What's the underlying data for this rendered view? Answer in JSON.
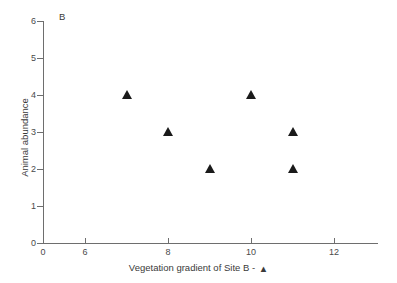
{
  "panel": {
    "label": "B"
  },
  "axes": {
    "y_title": "Animal abundance",
    "x_title": "Vegetation gradient of Site B -",
    "legend_marker_glyph": "▲",
    "y_ticks": [
      "0",
      "1",
      "2",
      "3",
      "4",
      "5",
      "6"
    ],
    "x_ticks": [
      "0",
      "6",
      "8",
      "10",
      "12"
    ]
  },
  "chart_data": {
    "type": "scatter",
    "title": "B",
    "xlabel": "Vegetation gradient of Site B -",
    "ylabel": "Animal abundance",
    "grid": false,
    "legend": "none",
    "marker": "triangle-up-filled",
    "marker_color": "#1a1a1a",
    "axis_color": "#6e6e6e",
    "xlim": [
      0,
      13
    ],
    "ylim": [
      0,
      6
    ],
    "xticks": [
      0,
      6,
      8,
      10,
      12
    ],
    "yticks": [
      0,
      1,
      2,
      3,
      4,
      5,
      6
    ],
    "x_axis_note": "broken/compressed segment between 0 and 6; uniform spacing from 6 to 12",
    "series": [
      {
        "name": "Site B",
        "points": [
          {
            "x": 7,
            "y": 4
          },
          {
            "x": 8,
            "y": 3
          },
          {
            "x": 9,
            "y": 2
          },
          {
            "x": 10,
            "y": 4
          },
          {
            "x": 11,
            "y": 3
          },
          {
            "x": 11,
            "y": 2
          }
        ]
      }
    ]
  },
  "geometry": {
    "x_pixel_of_zero": 43,
    "x_pixel_of_six": 85,
    "px_per_unit_x": 41.5,
    "y_pixel_of_zero": 243,
    "px_per_unit_y": 37
  }
}
